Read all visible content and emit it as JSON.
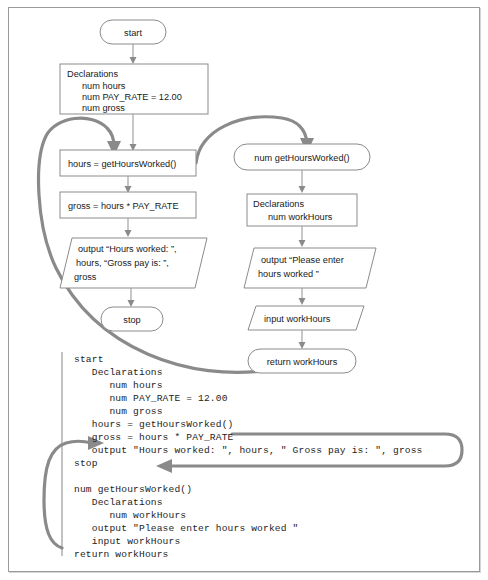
{
  "figure": {
    "accent_gray": "#8a8a8a",
    "node_stroke": "#8b8b8b",
    "border_color": "#9a9a9a"
  },
  "flowchart": {
    "main_program": {
      "start": "start",
      "declarations": {
        "header": "Declarations",
        "lines": [
          "num hours",
          "num PAY_RATE = 12.00",
          "num gross"
        ]
      },
      "call": "hours = getHoursWorked()",
      "compute": "gross = hours * PAY_RATE",
      "output": {
        "lines": [
          "output “Hours worked: ”,",
          "hours, “Gross pay is: ”,",
          "gross"
        ]
      },
      "stop": "stop"
    },
    "method": {
      "header": "num getHoursWorked()",
      "declarations": {
        "header": "Declarations",
        "lines": [
          "num workHours"
        ]
      },
      "output": {
        "lines": [
          "output “Please enter",
          "hours worked ”"
        ]
      },
      "input": "input workHours",
      "return": "return workHours"
    }
  },
  "pseudocode": {
    "lines": [
      "start",
      "   Declarations",
      "      num hours",
      "      num PAY_RATE = 12.00",
      "      num gross",
      "   hours = getHoursWorked()",
      "   gross = hours * PAY_RATE",
      "   output \"Hours worked: \", hours, \" Gross pay is: \", gross",
      "stop",
      "",
      "num getHoursWorked()",
      "   Declarations",
      "      num workHours",
      "   output \"Please enter hours worked \"",
      "   input workHours",
      "return workHours"
    ]
  }
}
